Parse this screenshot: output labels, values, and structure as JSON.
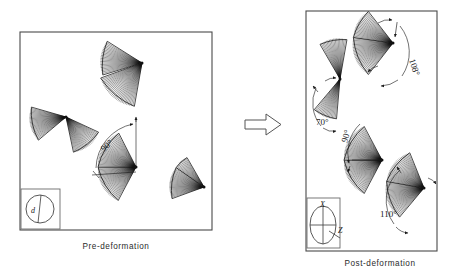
{
  "figure": {
    "type": "technical-diagram",
    "background": "#ffffff",
    "ink_color": "#111111",
    "border_color": "#4a4a4a"
  },
  "panels": [
    {
      "id": "pre",
      "caption": "Pre-deformation",
      "box": {
        "x": 20,
        "y": 32,
        "w": 192,
        "h": 198
      },
      "inset": {
        "box": {
          "x": 21,
          "y": 189,
          "w": 39,
          "h": 40
        },
        "shape": "circle",
        "labels": [
          {
            "text": "d",
            "x": 33,
            "y": 212
          }
        ]
      },
      "elements": [
        {
          "name": "fan-top",
          "hub": {
            "x": 142,
            "y": 63
          },
          "wedges": [
            {
              "start_angle": 163,
              "end_angle": 212,
              "radius": 41
            },
            {
              "start_angle": 100,
              "end_angle": 160,
              "radius": 44
            }
          ]
        },
        {
          "name": "fan-left",
          "hub": {
            "x": 66,
            "y": 117
          },
          "wedges": [
            {
              "start_angle": 140,
              "end_angle": 196,
              "radius": 36
            },
            {
              "start_angle": 25,
              "end_angle": 78,
              "radius": 36
            }
          ]
        },
        {
          "name": "fan-center",
          "hub": {
            "x": 136,
            "y": 167
          },
          "wedges": [
            {
              "start_angle": 118,
              "end_angle": 180,
              "radius": 38
            },
            {
              "start_angle": 180,
              "end_angle": 243,
              "radius": 38
            }
          ]
        },
        {
          "name": "fan-right",
          "hub": {
            "x": 204,
            "y": 187
          },
          "wedges": [
            {
              "start_angle": 160,
              "end_angle": 215,
              "radius": 34
            },
            {
              "start_angle": 215,
              "end_angle": 240,
              "radius": 34
            }
          ]
        }
      ],
      "angles": [
        {
          "value": "90°",
          "label_x": 104,
          "label_y": 152
        }
      ]
    },
    {
      "id": "post",
      "caption": "Post-deformation",
      "box": {
        "x": 306,
        "y": 11,
        "w": 131,
        "h": 240
      },
      "inset": {
        "box": {
          "x": 307,
          "y": 198,
          "w": 33,
          "h": 50
        },
        "shape": "ellipse",
        "labels": [
          {
            "text": "X",
            "x": 322,
            "y": 208
          },
          {
            "text": "Z",
            "x": 342,
            "y": 231
          }
        ]
      },
      "elements": [
        {
          "name": "fan-upper-left",
          "hub": {
            "x": 340,
            "y": 79
          },
          "wedges": [
            {
              "start_angle": 95,
              "end_angle": 130,
              "radius": 40
            },
            {
              "start_angle": 240,
              "end_angle": 280,
              "radius": 40
            }
          ]
        },
        {
          "name": "fan-upper-right",
          "hub": {
            "x": 393,
            "y": 43
          },
          "wedges": [
            {
              "start_angle": 128,
              "end_angle": 188,
              "radius": 40
            },
            {
              "start_angle": 188,
              "end_angle": 232,
              "radius": 40
            }
          ]
        },
        {
          "name": "fan-lower-left",
          "hub": {
            "x": 382,
            "y": 160
          },
          "wedges": [
            {
              "start_angle": 118,
              "end_angle": 180,
              "radius": 38
            },
            {
              "start_angle": 180,
              "end_angle": 242,
              "radius": 38
            }
          ]
        },
        {
          "name": "fan-lower-right",
          "hub": {
            "x": 424,
            "y": 188
          },
          "wedges": [
            {
              "start_angle": 130,
              "end_angle": 190,
              "radius": 38
            },
            {
              "start_angle": 190,
              "end_angle": 248,
              "radius": 38
            }
          ]
        }
      ],
      "angles": [
        {
          "value": "108°",
          "label_x": 410,
          "label_y": 58
        },
        {
          "value": "70°",
          "label_x": 318,
          "label_y": 122
        },
        {
          "value": "90°",
          "label_x": 347,
          "label_y": 142
        },
        {
          "value": "110°",
          "label_x": 382,
          "label_y": 215
        }
      ]
    }
  ],
  "transition_arrow": {
    "name": "transition-arrow",
    "direction": "right",
    "x": 245,
    "y": 124
  }
}
